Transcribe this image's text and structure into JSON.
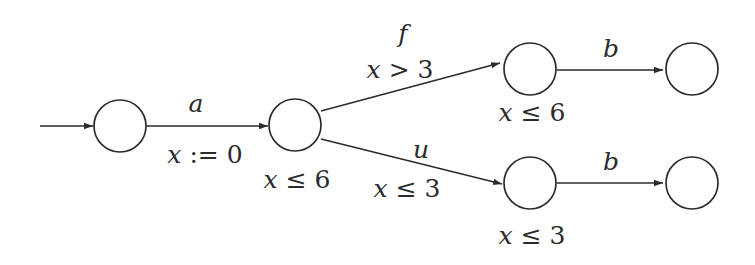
{
  "diagram": {
    "type": "timed-automaton",
    "stroke_color": "#2b2b2b",
    "background": "#ffffff",
    "nodes": [
      {
        "id": "q0",
        "label": "",
        "invariant": "",
        "initial": true
      },
      {
        "id": "q1",
        "label": "",
        "invariant_var": "x",
        "invariant_op": "≤",
        "invariant_val": "6"
      },
      {
        "id": "q2",
        "label": "",
        "invariant_var": "x",
        "invariant_op": "≤",
        "invariant_val": "6"
      },
      {
        "id": "q3",
        "label": "",
        "invariant": ""
      },
      {
        "id": "q4",
        "label": "",
        "invariant_var": "x",
        "invariant_op": "≤",
        "invariant_val": "3"
      },
      {
        "id": "q5",
        "label": "",
        "invariant": ""
      }
    ],
    "edges": [
      {
        "from": "q0",
        "to": "q1",
        "action": "a",
        "guard_or_reset_var": "x",
        "guard_or_reset_op": ":=",
        "guard_or_reset_val": "0"
      },
      {
        "from": "q1",
        "to": "q2",
        "action": "f",
        "guard_or_reset_var": "x",
        "guard_or_reset_op": ">",
        "guard_or_reset_val": "3"
      },
      {
        "from": "q1",
        "to": "q4",
        "action": "u",
        "guard_or_reset_var": "x",
        "guard_or_reset_op": "≤",
        "guard_or_reset_val": "3"
      },
      {
        "from": "q2",
        "to": "q3",
        "action": "b"
      },
      {
        "from": "q4",
        "to": "q5",
        "action": "b"
      }
    ]
  }
}
